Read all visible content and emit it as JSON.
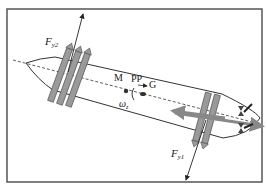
{
  "diagram": {
    "type": "ship force diagram (bow and stern thrusters, top view)",
    "labels": {
      "force_bow": "F",
      "force_bow_sub": "y2",
      "force_stern": "F",
      "force_stern_sub": "y1",
      "point_m": "M",
      "point_pp": "PP",
      "point_g": "G",
      "yaw_rate": "ω",
      "yaw_rate_sub": "z"
    },
    "colors": {
      "frame": "#555555",
      "hull": "#333333",
      "thruster": "#9a9a9a",
      "thruster_edge": "#444444",
      "arrow": "#222222",
      "background": "#ffffff"
    }
  }
}
